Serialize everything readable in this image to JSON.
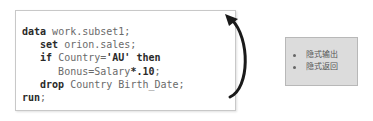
{
  "code_block": {
    "lines": [
      [
        {
          "t": "data",
          "k": "kw"
        },
        {
          "t": " work.subset1;",
          "k": "id"
        }
      ],
      [
        {
          "t": "   ",
          "k": "id"
        },
        {
          "t": "set",
          "k": "kw"
        },
        {
          "t": " orion.sales;",
          "k": "id"
        }
      ],
      [
        {
          "t": "   ",
          "k": "id"
        },
        {
          "t": "if",
          "k": "kw"
        },
        {
          "t": " Country=",
          "k": "id"
        },
        {
          "t": "'AU'",
          "k": "lit"
        },
        {
          "t": " ",
          "k": "id"
        },
        {
          "t": "then",
          "k": "kw"
        }
      ],
      [
        {
          "t": "      Bonus=Salary",
          "k": "id"
        },
        {
          "t": "*.10",
          "k": "lit"
        },
        {
          "t": ";",
          "k": "id"
        }
      ],
      [
        {
          "t": "   ",
          "k": "id"
        },
        {
          "t": "drop",
          "k": "kw"
        },
        {
          "t": " Country Birth_Date;",
          "k": "id"
        }
      ],
      [
        {
          "t": "run",
          "k": "kw"
        },
        {
          "t": ";",
          "k": "id"
        }
      ]
    ]
  },
  "arrow": {
    "direction": "loop-back-up",
    "color": "#1a1a1a"
  },
  "note_box": {
    "items": [
      "隐式输出",
      "隐式返回"
    ],
    "background": "#dcdcdc"
  }
}
